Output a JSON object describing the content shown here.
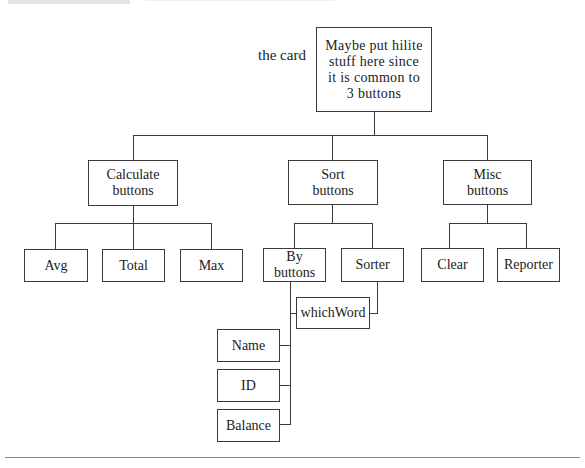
{
  "diagram": {
    "type": "tree",
    "annotation": "the card",
    "root": {
      "label": "Maybe put hilite stuff here since it is common to 3 buttons",
      "lines": [
        "Maybe put hilite",
        "stuff here since",
        "it is common to",
        "3 buttons"
      ]
    },
    "groups": [
      {
        "label": "Calculate buttons",
        "lines": [
          "Calculate",
          "buttons"
        ],
        "children": [
          "Avg",
          "Total",
          "Max"
        ]
      },
      {
        "label": "Sort buttons",
        "lines": [
          "Sort",
          "buttons"
        ],
        "children": [
          {
            "label": "By buttons",
            "lines": [
              "By",
              "buttons"
            ],
            "children": [
              "Name",
              "ID",
              "Balance",
              "whichWord"
            ]
          },
          {
            "label": "Sorter",
            "children": [
              "whichWord"
            ]
          }
        ]
      },
      {
        "label": "Misc buttons",
        "lines": [
          "Misc",
          "buttons"
        ],
        "children": [
          "Clear",
          "Reporter"
        ]
      }
    ],
    "shared_node": "whichWord",
    "by_buttons_children": [
      "Name",
      "ID",
      "Balance"
    ]
  }
}
